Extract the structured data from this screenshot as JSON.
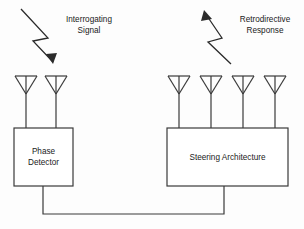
{
  "diagram": {
    "background_color": "#fdfdfd",
    "line_color": "#3a3a3a",
    "text_color": "#1a1a1a",
    "annotations": {
      "incoming": {
        "line1": "Interrogating",
        "line2": "Signal",
        "direction": "down-right",
        "icon": "lightning-bolt-arrow-down"
      },
      "outgoing": {
        "line1": "Retrodirective",
        "line2": "Response",
        "direction": "up-left",
        "icon": "lightning-bolt-arrow-up"
      }
    },
    "blocks": [
      {
        "id": "phase-detector",
        "line1": "Phase",
        "line2": "Detector",
        "antenna_count": 2
      },
      {
        "id": "steering-architecture",
        "line1": "Steering Architecture",
        "line2": "",
        "antenna_count": 4
      }
    ],
    "bus": {
      "label": "",
      "connects": "phase-detector to steering-architecture"
    }
  }
}
